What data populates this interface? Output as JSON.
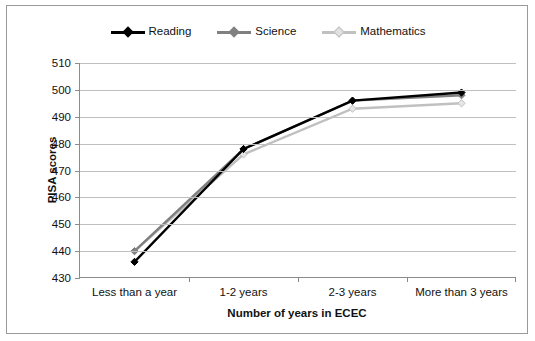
{
  "chart_data": {
    "type": "line",
    "title": "",
    "xlabel": "Number of years in ECEC",
    "ylabel": "PISA scores",
    "categories": [
      "Less than a year",
      "1-2 years",
      "2-3 years",
      "More than 3 years"
    ],
    "series": [
      {
        "name": "Reading",
        "values": [
          436,
          478,
          496,
          499
        ],
        "color": "#000000",
        "marker": "diamond"
      },
      {
        "name": "Science",
        "values": [
          440,
          478,
          496,
          498
        ],
        "color": "#808080",
        "marker": "diamond"
      },
      {
        "name": "Mathematics",
        "values": [
          440,
          476,
          493,
          495
        ],
        "color": "#c0c0c0",
        "marker": "diamond"
      }
    ],
    "ylim": [
      430,
      510
    ],
    "yticks": [
      430,
      440,
      450,
      460,
      470,
      480,
      490,
      500,
      510
    ],
    "ytick_labels": [
      "430",
      "440",
      "450",
      "460",
      "470",
      "480",
      "490",
      "500",
      "510"
    ],
    "grid": true,
    "legend_position": "top"
  },
  "colors": {
    "reading": "#000000",
    "science": "#808080",
    "mathematics": "#c0c0c0",
    "gridline": "#bfbfbf",
    "axis": "#8c8c8c",
    "border": "#9a9a9a"
  }
}
